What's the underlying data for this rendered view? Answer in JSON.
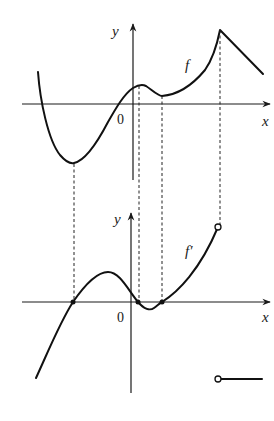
{
  "figure": {
    "top_graph": {
      "function_label": "f",
      "x_axis_label": "x",
      "y_axis_label": "y",
      "origin_label": "0"
    },
    "bottom_graph": {
      "function_label": "f′",
      "x_axis_label": "x",
      "y_axis_label": "y",
      "origin_label": "0"
    }
  }
}
